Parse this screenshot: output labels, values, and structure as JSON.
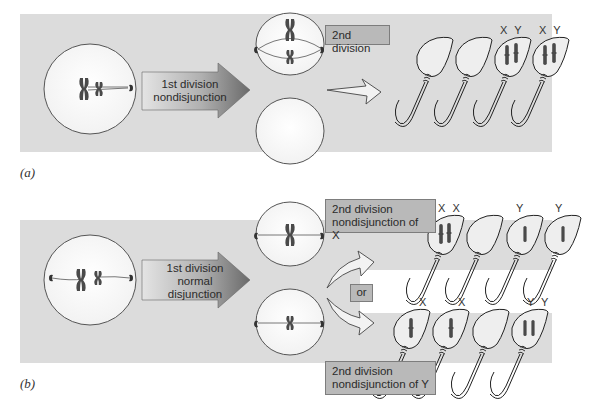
{
  "panels": {
    "a": {
      "label": "(a)",
      "arrow_text": [
        "1st division",
        "nondisjunction"
      ],
      "second_division_label": "2nd division",
      "gametes": [
        {
          "label": "",
          "chromosomes": []
        },
        {
          "label": "",
          "chromosomes": []
        },
        {
          "label": "X Y",
          "chromosomes": [
            "X",
            "Y"
          ]
        },
        {
          "label": "X Y",
          "chromosomes": [
            "X",
            "Y"
          ]
        }
      ]
    },
    "b": {
      "label": "(b)",
      "arrow_text": [
        "1st division",
        "normal",
        "disjunction"
      ],
      "top_box": [
        "2nd division",
        "nondisjunction of X"
      ],
      "bottom_box": [
        "2nd division",
        "nondisjunction of Y"
      ],
      "or_label": "or",
      "top_gametes": [
        {
          "label": "X X",
          "chromosomes": [
            "X",
            "X"
          ]
        },
        {
          "label": "",
          "chromosomes": []
        },
        {
          "label": "Y",
          "chromosomes": [
            "Y"
          ]
        },
        {
          "label": "Y",
          "chromosomes": [
            "Y"
          ]
        }
      ],
      "bottom_gametes": [
        {
          "label": "X",
          "chromosomes": [
            "X"
          ]
        },
        {
          "label": "X",
          "chromosomes": [
            "X"
          ]
        },
        {
          "label": "",
          "chromosomes": []
        },
        {
          "label": "Y Y",
          "chromosomes": [
            "Y",
            "Y"
          ]
        }
      ]
    }
  },
  "colors": {
    "band": "#dcdcdc",
    "box": "#b9b9b9",
    "arrow_dark": "#6e6e6e",
    "arrow_light": "#dedede",
    "chromosome": "#4a4a4a"
  }
}
